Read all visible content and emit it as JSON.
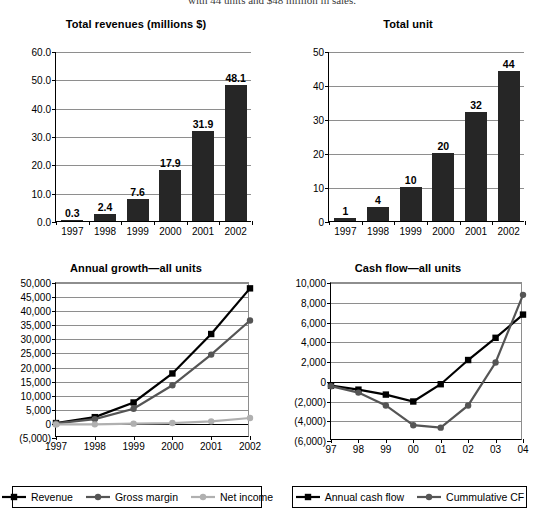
{
  "page": {
    "top_cropped_text": "with 44 units and $48 million in sales."
  },
  "charts": [
    {
      "id": "total-revenues",
      "chart_data": {
        "type": "bar",
        "title": "Total revenues (millions $)",
        "xlabel": "",
        "ylabel": "",
        "categories": [
          "1997",
          "1998",
          "1999",
          "2000",
          "2001",
          "2002"
        ],
        "values": [
          0.3,
          2.4,
          7.6,
          17.9,
          31.9,
          48.1
        ],
        "data_labels": [
          "0.3",
          "2.4",
          "7.6",
          "17.9",
          "31.9",
          "48.1"
        ],
        "ylim": [
          0.0,
          60.0
        ],
        "yticks": [
          0.0,
          10.0,
          20.0,
          30.0,
          40.0,
          50.0,
          60.0
        ],
        "ytick_labels": [
          "0.0",
          "10.0",
          "20.0",
          "30.0",
          "40.0",
          "50.0",
          "60.0"
        ],
        "grid": true,
        "legend": null,
        "bar_color": "#262626"
      }
    },
    {
      "id": "total-unit",
      "chart_data": {
        "type": "bar",
        "title": "Total unit",
        "xlabel": "",
        "ylabel": "",
        "categories": [
          "1997",
          "1998",
          "1999",
          "2000",
          "2001",
          "2002"
        ],
        "values": [
          1,
          4,
          10,
          20,
          32,
          44
        ],
        "data_labels": [
          "1",
          "4",
          "10",
          "20",
          "32",
          "44"
        ],
        "ylim": [
          0,
          50
        ],
        "yticks": [
          0,
          10,
          20,
          30,
          40,
          50
        ],
        "ytick_labels": [
          "0",
          "10",
          "20",
          "30",
          "40",
          "50"
        ],
        "grid": true,
        "legend": null,
        "bar_color": "#262626"
      }
    },
    {
      "id": "annual-growth",
      "chart_data": {
        "type": "line",
        "title": "Annual growth—all units",
        "xlabel": "",
        "ylabel": "",
        "x": [
          "1997",
          "1998",
          "1999",
          "2000",
          "2001",
          "2002"
        ],
        "series": [
          {
            "name": "Revenue",
            "values": [
              300,
              2400,
              7600,
              17900,
              31900,
              48100
            ],
            "color": "#000000",
            "marker": "square"
          },
          {
            "name": "Gross margin",
            "values": [
              200,
              1700,
              5400,
              13700,
              24600,
              36700
            ],
            "color": "#555555",
            "marker": "circle"
          },
          {
            "name": "Net income",
            "values": [
              -200,
              -150,
              100,
              300,
              900,
              2100
            ],
            "color": "#b0b0b0",
            "marker": "circle"
          }
        ],
        "ylim": [
          -5000,
          50000
        ],
        "yticks": [
          -5000,
          0,
          5000,
          10000,
          15000,
          20000,
          25000,
          30000,
          35000,
          40000,
          45000,
          50000
        ],
        "ytick_labels": [
          "(5,000)",
          "0",
          "5,000",
          "10,000",
          "15,000",
          "20,000",
          "25,000",
          "30,000",
          "35,000",
          "40,000",
          "45,000",
          "50,000"
        ],
        "grid": true,
        "legend_position": "bottom"
      }
    },
    {
      "id": "cash-flow",
      "chart_data": {
        "type": "line",
        "title": "Cash flow—all units",
        "xlabel": "",
        "ylabel": "",
        "x": [
          "97",
          "98",
          "99",
          "00",
          "01",
          "02",
          "03",
          "04"
        ],
        "series": [
          {
            "name": "Annual cash flow",
            "values": [
              -400,
              -800,
              -1300,
              -2000,
              -250,
              2200,
              4450,
              6800
            ],
            "color": "#000000",
            "marker": "square"
          },
          {
            "name": "Cummulative CF",
            "values": [
              -450,
              -1100,
              -2400,
              -4400,
              -4650,
              -2400,
              1950,
              8800
            ],
            "color": "#555555",
            "marker": "circle"
          }
        ],
        "ylim": [
          -6000,
          10000
        ],
        "yticks": [
          -6000,
          -4000,
          -2000,
          0,
          2000,
          4000,
          6000,
          8000,
          10000
        ],
        "ytick_labels": [
          "(6,000)",
          "(4,000)",
          "(2,000)",
          "0",
          "2,000",
          "4,000",
          "6,000",
          "8,000",
          "10,000"
        ],
        "grid": true,
        "legend_position": "bottom"
      }
    }
  ]
}
